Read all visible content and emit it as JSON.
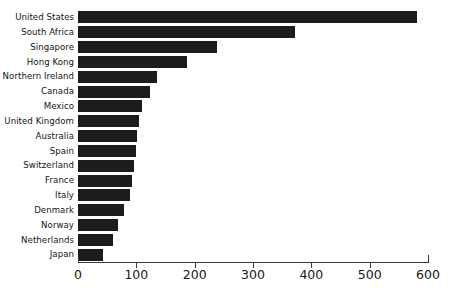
{
  "chart_data": {
    "type": "bar",
    "orientation": "horizontal",
    "title": "",
    "xlabel": "",
    "ylabel": "",
    "xlim": [
      0,
      600
    ],
    "ylim": null,
    "grid": false,
    "legend": null,
    "bar_color": "#1c1c1c",
    "axis_color": "#3a3a3a",
    "background_color": "#ffffff",
    "xticks": [
      0,
      100,
      200,
      300,
      400,
      500,
      600
    ],
    "xtick_labels": [
      "0",
      "100",
      "200",
      "300",
      "400",
      "500",
      "600"
    ],
    "categories": [
      "United States",
      "South Africa",
      "Singapore",
      "Hong Kong",
      "Northern Ireland",
      "Canada",
      "Mexico",
      "United Kingdom",
      "Australia",
      "Spain",
      "Switzerland",
      "France",
      "Italy",
      "Denmark",
      "Norway",
      "Netherlands",
      "Japan"
    ],
    "values": [
      581,
      372,
      238,
      187,
      135,
      123,
      110,
      105,
      101,
      99,
      96,
      93,
      89,
      79,
      69,
      60,
      43
    ]
  }
}
